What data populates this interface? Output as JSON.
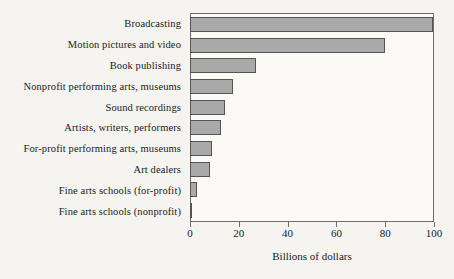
{
  "chart_data": {
    "type": "bar",
    "orientation": "horizontal",
    "title": "",
    "subtitle": "",
    "xlabel": "Billions of dollars",
    "ylabel": "",
    "xlim": [
      0,
      100
    ],
    "xticks": [
      0,
      20,
      40,
      60,
      80,
      100
    ],
    "xtick_labels": [
      "0",
      "20",
      "40",
      "60",
      "80",
      "100"
    ],
    "grid": false,
    "legend": null,
    "categories": [
      "Broadcasting",
      "Motion pictures and video",
      "Book publishing",
      "Nonprofit performing arts, museums",
      "Sound recordings",
      "Artists, writers, performers",
      "For-profit performing arts, museums",
      "Art dealers",
      "Fine arts schools (for-profit)",
      "Fine arts schools (nonprofit)"
    ],
    "values": [
      100,
      80,
      27,
      17.5,
      14.5,
      12.5,
      9,
      8,
      3,
      1
    ],
    "colors": {
      "bar_fill": "#a9a9a9",
      "bar_border": "#555555",
      "axis": "#6d6d6d",
      "text": "#1b1b1b",
      "background": "#f5f4f0",
      "plot_background": "#fbfaf7"
    }
  }
}
